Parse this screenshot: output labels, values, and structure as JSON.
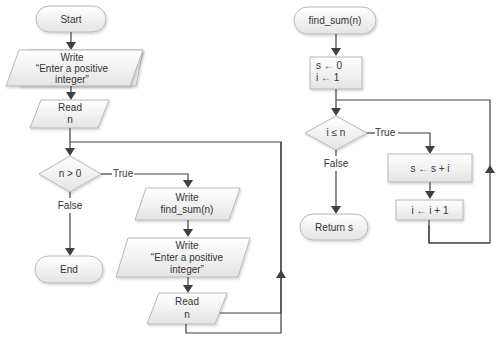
{
  "diagram": {
    "main": {
      "start": "Start",
      "write1": {
        "line1": "Write",
        "line2": "“Enter a positive",
        "line3": "integer”"
      },
      "read1": {
        "line1": "Read",
        "line2": "n"
      },
      "decision": "n > 0",
      "true_label": "True",
      "false_label": "False",
      "end": "End",
      "write_sum": {
        "line1": "Write",
        "line2": "find_sum(n)"
      },
      "write2": {
        "line1": "Write",
        "line2": "“Enter a positive",
        "line3": "integer”"
      },
      "read2": {
        "line1": "Read",
        "line2": "n"
      }
    },
    "func": {
      "start": "find_sum(n)",
      "init": {
        "line1": "s ← 0",
        "line2": "i ← 1"
      },
      "decision": "i ≤ n",
      "true_label": "True",
      "false_label": "False",
      "body1": "s ← s + i",
      "body2": "i ← i + 1",
      "return": "Return s"
    },
    "colors": {
      "shape_fill_top": "#ffffff",
      "shape_fill_bottom": "#e6e6e6",
      "shape_stroke": "#b8b8b8",
      "line": "#404040"
    }
  }
}
